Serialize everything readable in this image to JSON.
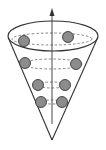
{
  "diagram": {
    "title": "",
    "colors": {
      "background": "#ffffff",
      "line": "#333333",
      "dash": "#666666",
      "sphere_fill": "#8c8c8c",
      "sphere_stroke": "#3a3a3a"
    },
    "cone": {
      "rim": {
        "cx": 53,
        "cy": 36,
        "rx": 45,
        "ry": 15
      },
      "left_edge": {
        "x1": 8,
        "y1": 37,
        "x2": 52,
        "y2": 140
      },
      "right_edge": {
        "x1": 98,
        "y1": 37,
        "x2": 52,
        "y2": 140
      },
      "apex": {
        "x": 52,
        "y": 140
      }
    },
    "axis": {
      "x": 52,
      "y_start": 124,
      "y_end": 8,
      "arrow": true
    },
    "orbits": [
      {
        "cy": 39,
        "rx": 40,
        "ry": 6
      },
      {
        "cy": 64,
        "rx": 30,
        "ry": 5
      },
      {
        "cy": 85,
        "rx": 15,
        "ry": 3
      },
      {
        "cy": 102,
        "rx": 12,
        "ry": 2
      }
    ],
    "spheres": [
      {
        "x": 24,
        "y": 41,
        "r": 5.5
      },
      {
        "x": 68,
        "y": 37,
        "r": 5.5
      },
      {
        "x": 25,
        "y": 63,
        "r": 5.5
      },
      {
        "x": 76,
        "y": 64,
        "r": 5.5
      },
      {
        "x": 38,
        "y": 85,
        "r": 5.5
      },
      {
        "x": 65,
        "y": 85,
        "r": 5.5
      },
      {
        "x": 41,
        "y": 102,
        "r": 5.5
      },
      {
        "x": 62,
        "y": 102,
        "r": 5.5
      }
    ]
  }
}
